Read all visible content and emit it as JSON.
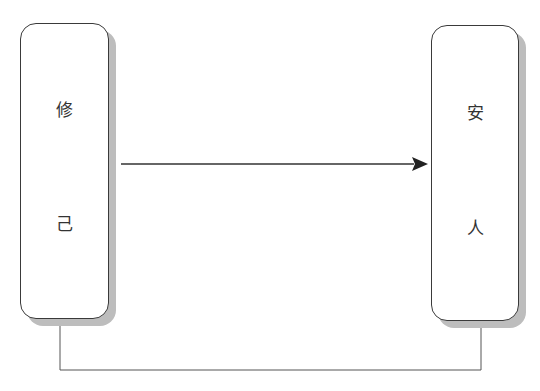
{
  "diagram": {
    "left_box": {
      "chars": [
        "修",
        "己"
      ]
    },
    "right_box": {
      "chars": [
        "安",
        "人"
      ]
    },
    "arrow": {
      "from": "left_box",
      "to": "right_box",
      "direction": "right"
    },
    "connector": {
      "type": "bottom-loop",
      "between": [
        "left_box",
        "right_box"
      ]
    },
    "colors": {
      "stroke": "#3a3a3a",
      "shadow": "#bdbdbd"
    }
  }
}
